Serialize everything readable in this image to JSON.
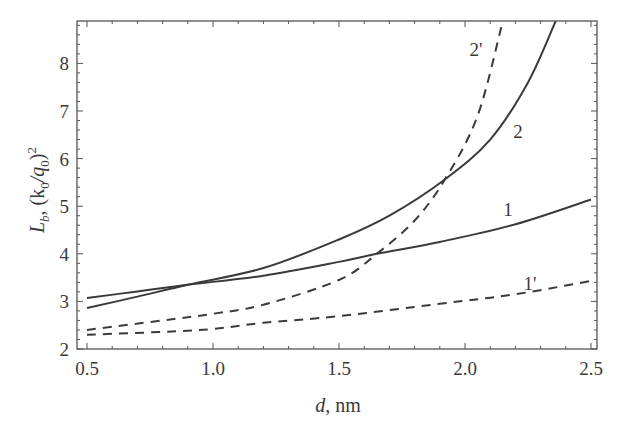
{
  "chart_data": {
    "type": "line",
    "title": "",
    "xlabel": "d, nm",
    "ylabel": "L_b, (k_0/q_0)^2",
    "xlim": [
      0.46,
      2.52
    ],
    "ylim": [
      2.0,
      8.9
    ],
    "xticks": [
      "0.5",
      "1.0",
      "1.5",
      "2.0",
      "2.5"
    ],
    "yticks": [
      "2",
      "3",
      "4",
      "5",
      "6",
      "7",
      "8"
    ],
    "grid": false,
    "legend": "inline curve labels",
    "series": [
      {
        "name": "1",
        "style": "solid",
        "x": [
          0.5,
          0.7,
          0.9,
          1.2,
          1.5,
          1.65,
          1.9,
          2.2,
          2.5
        ],
        "y": [
          3.07,
          3.21,
          3.35,
          3.54,
          3.83,
          4.0,
          4.25,
          4.62,
          5.14
        ]
      },
      {
        "name": "2",
        "style": "solid",
        "x": [
          0.5,
          0.7,
          0.9,
          1.2,
          1.5,
          1.7,
          1.92,
          2.1,
          2.25,
          2.36
        ],
        "y": [
          2.86,
          3.1,
          3.35,
          3.7,
          4.3,
          4.8,
          5.56,
          6.4,
          7.6,
          8.89
        ]
      },
      {
        "name": "2'",
        "style": "dashed",
        "x": [
          0.5,
          0.8,
          1.0,
          1.2,
          1.5,
          1.65,
          1.8,
          1.92,
          2.05,
          2.15
        ],
        "y": [
          2.4,
          2.6,
          2.74,
          2.93,
          3.45,
          4.0,
          4.7,
          5.56,
          6.9,
          8.89
        ]
      },
      {
        "name": "1'",
        "style": "dashed",
        "x": [
          0.5,
          0.8,
          1.0,
          1.2,
          1.5,
          1.9,
          2.2,
          2.5
        ],
        "y": [
          2.3,
          2.36,
          2.42,
          2.55,
          2.69,
          2.95,
          3.15,
          3.43
        ]
      }
    ],
    "annotations": [
      {
        "text": "2'",
        "x": 2.0,
        "y": 8.3
      },
      {
        "text": "2",
        "x": 2.2,
        "y": 6.6
      },
      {
        "text": "1",
        "x": 2.15,
        "y": 4.9
      },
      {
        "text": "1'",
        "x": 2.25,
        "y": 3.5
      }
    ]
  },
  "labels": {
    "x_axis_main": "d",
    "x_axis_unit": ", nm",
    "y_axis_L": "L",
    "y_axis_b": "b",
    "y_axis_rest": ", (k",
    "y_axis_0a": "0",
    "y_axis_slash": "/q",
    "y_axis_0b": "0",
    "y_axis_close": ")",
    "y_axis_sq": "2"
  }
}
